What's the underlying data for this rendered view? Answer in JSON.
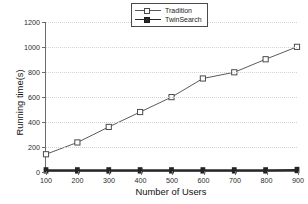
{
  "chart_data": {
    "type": "line",
    "title": "",
    "xlabel": "Number of Users",
    "ylabel": "Running time(s)",
    "x": [
      100,
      200,
      300,
      400,
      500,
      600,
      700,
      800,
      900
    ],
    "xticklabels": [
      "100",
      "200",
      "300",
      "400",
      "500",
      "600",
      "700",
      "800",
      "900"
    ],
    "yticklabels": [
      "0",
      "200",
      "400",
      "600",
      "800",
      "1000",
      "1200"
    ],
    "yticks": [
      0,
      200,
      400,
      600,
      800,
      1000,
      1200
    ],
    "xlim": [
      100,
      900
    ],
    "ylim": [
      0,
      1200
    ],
    "grid": true,
    "grid_axis": "y",
    "legend_position": "top-right",
    "series": [
      {
        "name": "Tradition",
        "marker": "open-square",
        "color": "#5a5a5a",
        "values": [
          135,
          230,
          355,
          475,
          595,
          745,
          795,
          900,
          1000
        ]
      },
      {
        "name": "TwinSearch",
        "marker": "filled-star-square",
        "color": "#2a2a2a",
        "values": [
          5,
          5,
          5,
          5,
          5,
          5,
          5,
          5,
          8
        ]
      }
    ]
  },
  "legend": {
    "items": [
      {
        "label": "Tradition"
      },
      {
        "label": "TwinSearch"
      }
    ]
  }
}
